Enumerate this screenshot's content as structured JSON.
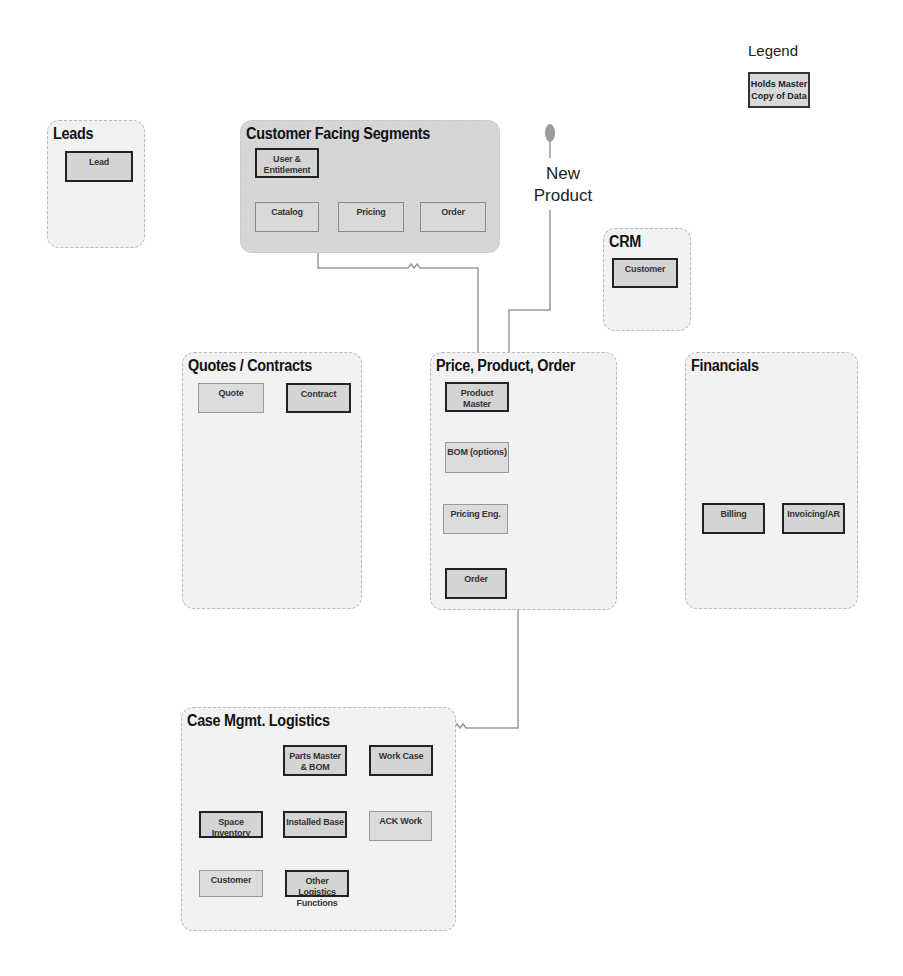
{
  "legend": {
    "title": "Legend",
    "item_label": "Holds Master Copy of Data"
  },
  "new_product": {
    "label_line1": "New",
    "label_line2": "Product"
  },
  "groups": {
    "leads": {
      "title": "Leads",
      "nodes": [
        {
          "label": "Lead",
          "master": true
        }
      ]
    },
    "customer_facing": {
      "title": "Customer Facing Segments",
      "nodes": [
        {
          "label": "User & Entitlement",
          "master": true
        },
        {
          "label": "Catalog",
          "master": false
        },
        {
          "label": "Pricing",
          "master": false
        },
        {
          "label": "Order",
          "master": false
        }
      ]
    },
    "crm": {
      "title": "CRM",
      "nodes": [
        {
          "label": "Customer",
          "master": true
        }
      ]
    },
    "quotes": {
      "title": "Quotes / Contracts",
      "nodes": [
        {
          "label": "Quote",
          "master": false
        },
        {
          "label": "Contract",
          "master": true
        }
      ]
    },
    "ppo": {
      "title": "Price, Product, Order",
      "nodes": [
        {
          "label": "Product Master",
          "master": true
        },
        {
          "label": "BOM (options)",
          "master": false
        },
        {
          "label": "Pricing Eng.",
          "master": false
        },
        {
          "label": "Order",
          "master": true
        }
      ]
    },
    "financials": {
      "title": "Financials",
      "nodes": [
        {
          "label": "Billing",
          "master": true
        },
        {
          "label": "Invoicing/AR",
          "master": true
        }
      ]
    },
    "case_mgmt": {
      "title": "Case Mgmt. Logistics",
      "nodes": [
        {
          "label": "Parts Master & BOM",
          "master": true
        },
        {
          "label": "Work Case",
          "master": true
        },
        {
          "label": "Space Inventory",
          "master": true
        },
        {
          "label": "Installed Base",
          "master": true
        },
        {
          "label": "ACK Work",
          "master": false
        },
        {
          "label": "Customer",
          "master": false
        },
        {
          "label": "Other Logistics Functions",
          "master": true
        }
      ]
    }
  },
  "connectors": [
    {
      "from": "Product Master",
      "to": "Catalog"
    },
    {
      "from": "New Product",
      "to": "Product Master"
    },
    {
      "from": "Product Master",
      "to": "Parts Master & BOM"
    }
  ],
  "colors": {
    "group_fill": "#f2f2f2",
    "group_fill_dark": "#d6d6d6",
    "node_fill": "#d9d9d9",
    "wire": "#999999",
    "start_dot": "#999999"
  }
}
